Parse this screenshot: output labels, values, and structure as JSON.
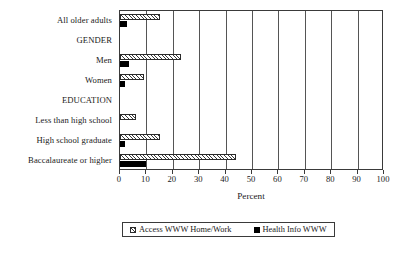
{
  "chart_data": {
    "type": "bar",
    "orientation": "horizontal",
    "title": "",
    "xlabel": "Percent",
    "ylabel": "",
    "xlim": [
      0,
      100
    ],
    "xticks": [
      0,
      10,
      20,
      30,
      40,
      50,
      60,
      70,
      80,
      90,
      100
    ],
    "grid": true,
    "legend_position": "bottom",
    "categories": [
      "All older adults",
      "GENDER",
      "Men",
      "Women",
      "EDUCATION",
      "Less than high school",
      "High school graduate",
      "Baccalaureate or higher"
    ],
    "category_is_heading": [
      false,
      true,
      false,
      false,
      true,
      false,
      false,
      false
    ],
    "series": [
      {
        "name": "Access WWW Home/Work",
        "pattern": "hatched",
        "values": [
          15,
          null,
          23,
          9,
          null,
          6,
          15,
          44
        ]
      },
      {
        "name": "Health Info WWW",
        "pattern": "solid-black",
        "values": [
          2.5,
          null,
          3.5,
          2,
          null,
          0,
          2,
          10
        ]
      }
    ]
  },
  "axis": {
    "x_title": "Percent",
    "tick_labels": [
      "0",
      "10",
      "20",
      "30",
      "40",
      "50",
      "60",
      "70",
      "80",
      "90",
      "100"
    ]
  },
  "legend": {
    "entries": [
      {
        "label": "Access WWW Home/Work",
        "swatch": "hatched-swatch"
      },
      {
        "label": "Health Info WWW",
        "swatch": "black-swatch"
      }
    ]
  },
  "colors": {
    "axis": "#3a3a3a",
    "series_a_fill": "#ffffff",
    "series_a_hatch": "#3a3a3a",
    "series_b_fill": "#000000",
    "background": "#ffffff"
  }
}
